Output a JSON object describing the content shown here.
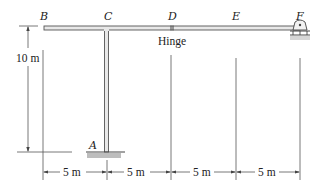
{
  "diagram": {
    "points": {
      "A": "A",
      "B": "B",
      "C": "C",
      "D": "D",
      "E": "E",
      "F": "F"
    },
    "hinge_label": "Hinge",
    "height_dimension": "10 m",
    "span_dimensions": [
      "5 m",
      "5 m",
      "5 m",
      "5 m"
    ],
    "colors": {
      "member_fill": "#e8e8e8",
      "member_stroke": "#555555",
      "line": "#444444",
      "support_hatch": "#bdbdbd"
    }
  }
}
